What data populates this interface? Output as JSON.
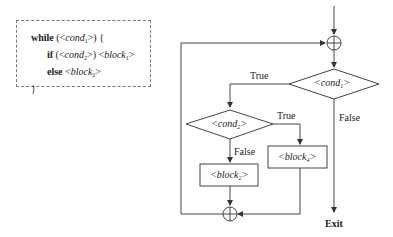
{
  "code": {
    "line1_kw": "while",
    "line1_rest_pre": " (<",
    "line1_var": "cond",
    "line1_sub": "1",
    "line1_post": ">) {",
    "line2_kw": "if",
    "line2_pre": " (<",
    "line2_var": "cond",
    "line2_sub": "2",
    "line2_mid": ">) <",
    "line2_var2": "block",
    "line2_sub2": "1",
    "line2_post": ">",
    "line3_kw": "else",
    "line3_pre": " <",
    "line3_var": "block",
    "line3_sub": "2",
    "line3_post": ">",
    "line4": "}"
  },
  "flowchart": {
    "cond1": {
      "name": "cond",
      "sub": "1"
    },
    "cond2": {
      "name": "cond",
      "sub": "2"
    },
    "block4": {
      "name": "block",
      "sub": "4"
    },
    "block2": {
      "name": "block",
      "sub": "2"
    },
    "true1": "True",
    "true2": "True",
    "false1": "False",
    "false2": "False",
    "exit": "Exit"
  }
}
